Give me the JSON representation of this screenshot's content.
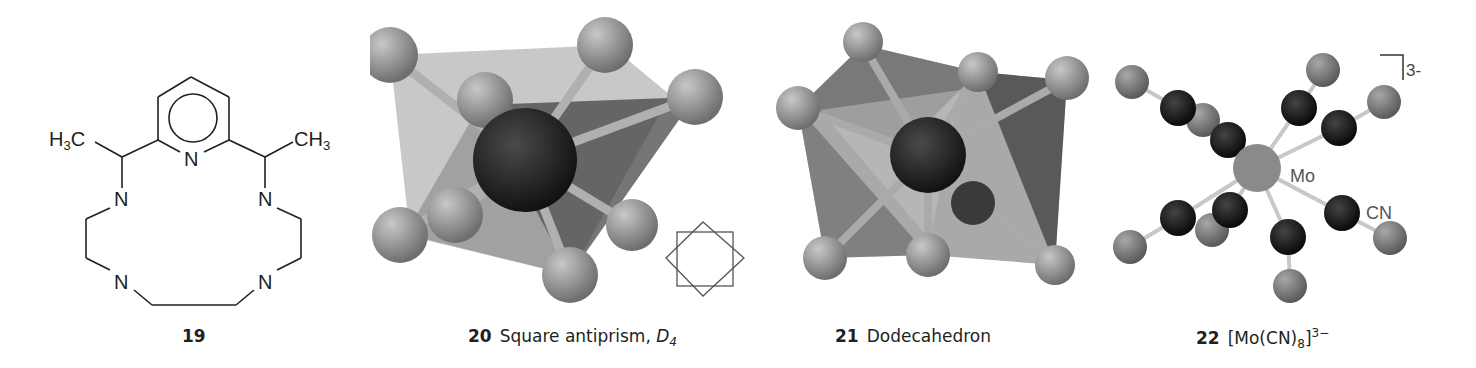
{
  "figures": [
    {
      "number": "19",
      "label": "",
      "type": "structural-formula",
      "atoms": {
        "ring_n": "N",
        "amine_n": "N",
        "methyl_left": "H3C",
        "methyl_right": "CH3"
      }
    },
    {
      "number": "20",
      "label": "Square antiprism, ",
      "symmetry": "D",
      "symmetry_sub": "4",
      "type": "ball-and-stick-polyhedron"
    },
    {
      "number": "21",
      "label": "Dodecahedron",
      "type": "ball-and-stick-polyhedron"
    },
    {
      "number": "22",
      "formula_open": "[Mo(CN)",
      "formula_sub": "8",
      "formula_close": "]",
      "formula_sup": "3−",
      "type": "ball-and-stick-complex",
      "labels": {
        "metal": "Mo",
        "ligand": "CN",
        "charge": "3-"
      }
    }
  ],
  "colors": {
    "line": "#231f20",
    "ball_gray": "#8a8a8a",
    "ball_dark": "#1a1a1a",
    "face_light": "#b5b5b5",
    "face_dark": "#4a4a4a"
  }
}
